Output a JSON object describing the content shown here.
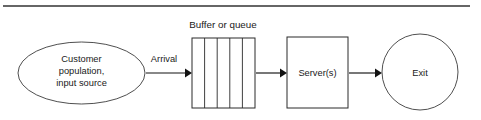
{
  "figure": {
    "kind": "queueing-system-flow-diagram",
    "top_rule": {
      "visible": true,
      "x1": 3,
      "x2": 470,
      "y": 6,
      "color": "#333333"
    }
  },
  "captions": {
    "buffer_caption": "Buffer or queue"
  },
  "nodes": {
    "source": {
      "shape": "ellipse",
      "lines": [
        "Customer",
        "population,",
        "input source"
      ],
      "line1": "Customer",
      "line2": "population,",
      "line3": "input source",
      "cx": 81.5,
      "cy": 73,
      "rx": 63.5,
      "ry": 31
    },
    "buffer": {
      "shape": "rect",
      "label": "",
      "x": 192,
      "y": 38,
      "width": 63,
      "height": 70,
      "compartments": 5,
      "divider_x": [
        204.6,
        217.2,
        229.8,
        242.4
      ]
    },
    "server": {
      "shape": "rect",
      "label": "Server(s)",
      "x": 287,
      "y": 37,
      "width": 61,
      "height": 71
    },
    "exit": {
      "shape": "circle",
      "label": "Exit",
      "cx": 420,
      "cy": 72,
      "r": 38
    }
  },
  "edges": [
    {
      "name": "arrival",
      "label": "Arrival",
      "x1": 146,
      "x2": 192,
      "y": 73,
      "label_x": 164,
      "label_y": 62
    },
    {
      "name": "queue-to-server",
      "label": "",
      "x1": 256,
      "x2": 287,
      "y": 73
    },
    {
      "name": "server-to-exit",
      "label": "",
      "x1": 349,
      "x2": 382,
      "y": 73
    }
  ],
  "edge_labels": {
    "arrival": "Arrival"
  },
  "colors": {
    "ink": "#1a1a1a",
    "stroke": "#2a2a2a",
    "arrow": "#121212",
    "rule": "#333333",
    "background": "#ffffff"
  }
}
